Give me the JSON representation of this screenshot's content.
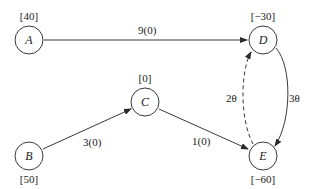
{
  "diagram": {
    "type": "network-flow-graph",
    "nodes": [
      {
        "id": "A",
        "label": "A",
        "supply": "[40]",
        "x": 29,
        "y": 40
      },
      {
        "id": "B",
        "label": "B",
        "supply": "[50]",
        "x": 29,
        "y": 156
      },
      {
        "id": "C",
        "label": "C",
        "supply": "[0]",
        "x": 145,
        "y": 102
      },
      {
        "id": "D",
        "label": "D",
        "supply": "[−30]",
        "x": 263,
        "y": 40
      },
      {
        "id": "E",
        "label": "E",
        "supply": "[−60]",
        "x": 263,
        "y": 156
      }
    ],
    "edges": [
      {
        "from": "A",
        "to": "D",
        "label": "9(0)",
        "style": "solid"
      },
      {
        "from": "B",
        "to": "C",
        "label": "3(0)",
        "style": "solid"
      },
      {
        "from": "C",
        "to": "E",
        "label": "1(0)",
        "style": "solid"
      },
      {
        "from": "D",
        "to": "E",
        "label": "3θ",
        "style": "solid"
      },
      {
        "from": "E",
        "to": "D",
        "label": "2θ",
        "style": "dashed"
      }
    ]
  }
}
